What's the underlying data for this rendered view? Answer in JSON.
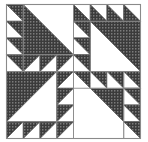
{
  "figure": {
    "kind": "quilt-block-diagram",
    "caption": ""
  },
  "canvas": {
    "width": 148,
    "height": 142,
    "background": "#ffffff"
  },
  "block": {
    "name": "Dutchman's Puzzle pinwheel",
    "x": 6.5,
    "y": 4.5,
    "size": 134,
    "grid_units": 8,
    "unit": 16.75,
    "quadrants": 4,
    "rotation_symmetry": "4-fold (90 degrees)"
  },
  "colors": {
    "fabric_dark": "#3b3b3b",
    "fabric_dark_dots": "#d9d9d9",
    "fabric_light": "#ffffff",
    "seam_line": "#8a8a8a",
    "frame_line": "#8a8a8a",
    "background": "#ffffff"
  },
  "strokes": {
    "frame_width": 1.1,
    "seam_width": 0.9,
    "patch_width": 0.7
  },
  "texture": {
    "name": "dotted-dark-fabric",
    "dot_spacing": 3,
    "dot_radius": 0.55
  },
  "legend": {
    "dark_label": "dark print fabric",
    "light_label": "background fabric"
  },
  "parts": {
    "blade_label": "large half-square triangle blade",
    "sawtooth_label": "sawtooth half-square triangle",
    "plain_label": "plain background square",
    "center_label": "center pinwheel point"
  },
  "counts": {
    "large_blades": 4,
    "sawtooth_per_edge": 4,
    "sawtooth_total": 32,
    "plain_squares": 4
  }
}
